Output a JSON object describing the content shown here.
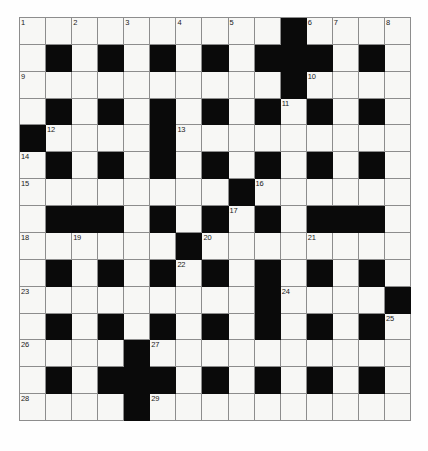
{
  "puzzle": {
    "type": "crossword-grid",
    "rows": 15,
    "columns": 15,
    "colors": {
      "block": "#0a0a0a",
      "cell": "#f7f7f5",
      "gridline": "#8d8d8d",
      "number": "#1a1a1a",
      "page_background": "#fefefe"
    },
    "grid": [
      [
        {
          "block": false,
          "number": "1"
        },
        {
          "block": false,
          "number": ""
        },
        {
          "block": false,
          "number": "2"
        },
        {
          "block": false,
          "number": ""
        },
        {
          "block": false,
          "number": "3"
        },
        {
          "block": false,
          "number": ""
        },
        {
          "block": false,
          "number": "4"
        },
        {
          "block": false,
          "number": ""
        },
        {
          "block": false,
          "number": "5"
        },
        {
          "block": false,
          "number": ""
        },
        {
          "block": true,
          "number": ""
        },
        {
          "block": false,
          "number": "6"
        },
        {
          "block": false,
          "number": "7"
        },
        {
          "block": false,
          "number": ""
        },
        {
          "block": false,
          "number": "8"
        }
      ],
      [
        {
          "block": false,
          "number": ""
        },
        {
          "block": true,
          "number": ""
        },
        {
          "block": false,
          "number": ""
        },
        {
          "block": true,
          "number": ""
        },
        {
          "block": false,
          "number": ""
        },
        {
          "block": true,
          "number": ""
        },
        {
          "block": false,
          "number": ""
        },
        {
          "block": true,
          "number": ""
        },
        {
          "block": false,
          "number": ""
        },
        {
          "block": true,
          "number": ""
        },
        {
          "block": true,
          "number": ""
        },
        {
          "block": true,
          "number": ""
        },
        {
          "block": false,
          "number": ""
        },
        {
          "block": true,
          "number": ""
        },
        {
          "block": false,
          "number": ""
        }
      ],
      [
        {
          "block": false,
          "number": "9"
        },
        {
          "block": false,
          "number": ""
        },
        {
          "block": false,
          "number": ""
        },
        {
          "block": false,
          "number": ""
        },
        {
          "block": false,
          "number": ""
        },
        {
          "block": false,
          "number": ""
        },
        {
          "block": false,
          "number": ""
        },
        {
          "block": false,
          "number": ""
        },
        {
          "block": false,
          "number": ""
        },
        {
          "block": false,
          "number": ""
        },
        {
          "block": true,
          "number": ""
        },
        {
          "block": false,
          "number": "10"
        },
        {
          "block": false,
          "number": ""
        },
        {
          "block": false,
          "number": ""
        },
        {
          "block": false,
          "number": ""
        }
      ],
      [
        {
          "block": false,
          "number": ""
        },
        {
          "block": true,
          "number": ""
        },
        {
          "block": false,
          "number": ""
        },
        {
          "block": true,
          "number": ""
        },
        {
          "block": false,
          "number": ""
        },
        {
          "block": true,
          "number": ""
        },
        {
          "block": false,
          "number": ""
        },
        {
          "block": true,
          "number": ""
        },
        {
          "block": false,
          "number": ""
        },
        {
          "block": true,
          "number": ""
        },
        {
          "block": false,
          "number": "11"
        },
        {
          "block": true,
          "number": ""
        },
        {
          "block": false,
          "number": ""
        },
        {
          "block": true,
          "number": ""
        },
        {
          "block": false,
          "number": ""
        }
      ],
      [
        {
          "block": true,
          "number": ""
        },
        {
          "block": false,
          "number": "12"
        },
        {
          "block": false,
          "number": ""
        },
        {
          "block": false,
          "number": ""
        },
        {
          "block": false,
          "number": ""
        },
        {
          "block": true,
          "number": ""
        },
        {
          "block": false,
          "number": "13"
        },
        {
          "block": false,
          "number": ""
        },
        {
          "block": false,
          "number": ""
        },
        {
          "block": false,
          "number": ""
        },
        {
          "block": false,
          "number": ""
        },
        {
          "block": false,
          "number": ""
        },
        {
          "block": false,
          "number": ""
        },
        {
          "block": false,
          "number": ""
        },
        {
          "block": false,
          "number": ""
        }
      ],
      [
        {
          "block": false,
          "number": "14"
        },
        {
          "block": true,
          "number": ""
        },
        {
          "block": false,
          "number": ""
        },
        {
          "block": true,
          "number": ""
        },
        {
          "block": false,
          "number": ""
        },
        {
          "block": true,
          "number": ""
        },
        {
          "block": false,
          "number": ""
        },
        {
          "block": true,
          "number": ""
        },
        {
          "block": false,
          "number": ""
        },
        {
          "block": true,
          "number": ""
        },
        {
          "block": false,
          "number": ""
        },
        {
          "block": true,
          "number": ""
        },
        {
          "block": false,
          "number": ""
        },
        {
          "block": true,
          "number": ""
        },
        {
          "block": false,
          "number": ""
        }
      ],
      [
        {
          "block": false,
          "number": "15"
        },
        {
          "block": false,
          "number": ""
        },
        {
          "block": false,
          "number": ""
        },
        {
          "block": false,
          "number": ""
        },
        {
          "block": false,
          "number": ""
        },
        {
          "block": false,
          "number": ""
        },
        {
          "block": false,
          "number": ""
        },
        {
          "block": false,
          "number": ""
        },
        {
          "block": true,
          "number": ""
        },
        {
          "block": false,
          "number": "16"
        },
        {
          "block": false,
          "number": ""
        },
        {
          "block": false,
          "number": ""
        },
        {
          "block": false,
          "number": ""
        },
        {
          "block": false,
          "number": ""
        },
        {
          "block": false,
          "number": ""
        }
      ],
      [
        {
          "block": false,
          "number": ""
        },
        {
          "block": true,
          "number": ""
        },
        {
          "block": true,
          "number": ""
        },
        {
          "block": true,
          "number": ""
        },
        {
          "block": false,
          "number": ""
        },
        {
          "block": true,
          "number": ""
        },
        {
          "block": false,
          "number": ""
        },
        {
          "block": true,
          "number": ""
        },
        {
          "block": false,
          "number": "17"
        },
        {
          "block": true,
          "number": ""
        },
        {
          "block": false,
          "number": ""
        },
        {
          "block": true,
          "number": ""
        },
        {
          "block": true,
          "number": ""
        },
        {
          "block": true,
          "number": ""
        },
        {
          "block": false,
          "number": ""
        }
      ],
      [
        {
          "block": false,
          "number": "18"
        },
        {
          "block": false,
          "number": ""
        },
        {
          "block": false,
          "number": "19"
        },
        {
          "block": false,
          "number": ""
        },
        {
          "block": false,
          "number": ""
        },
        {
          "block": false,
          "number": ""
        },
        {
          "block": true,
          "number": ""
        },
        {
          "block": false,
          "number": "20"
        },
        {
          "block": false,
          "number": ""
        },
        {
          "block": false,
          "number": ""
        },
        {
          "block": false,
          "number": ""
        },
        {
          "block": false,
          "number": "21"
        },
        {
          "block": false,
          "number": ""
        },
        {
          "block": false,
          "number": ""
        },
        {
          "block": false,
          "number": ""
        }
      ],
      [
        {
          "block": false,
          "number": ""
        },
        {
          "block": true,
          "number": ""
        },
        {
          "block": false,
          "number": ""
        },
        {
          "block": true,
          "number": ""
        },
        {
          "block": false,
          "number": ""
        },
        {
          "block": true,
          "number": ""
        },
        {
          "block": false,
          "number": "22"
        },
        {
          "block": true,
          "number": ""
        },
        {
          "block": false,
          "number": ""
        },
        {
          "block": true,
          "number": ""
        },
        {
          "block": false,
          "number": ""
        },
        {
          "block": true,
          "number": ""
        },
        {
          "block": false,
          "number": ""
        },
        {
          "block": true,
          "number": ""
        },
        {
          "block": false,
          "number": ""
        }
      ],
      [
        {
          "block": false,
          "number": "23"
        },
        {
          "block": false,
          "number": ""
        },
        {
          "block": false,
          "number": ""
        },
        {
          "block": false,
          "number": ""
        },
        {
          "block": false,
          "number": ""
        },
        {
          "block": false,
          "number": ""
        },
        {
          "block": false,
          "number": ""
        },
        {
          "block": false,
          "number": ""
        },
        {
          "block": false,
          "number": ""
        },
        {
          "block": true,
          "number": ""
        },
        {
          "block": false,
          "number": "24"
        },
        {
          "block": false,
          "number": ""
        },
        {
          "block": false,
          "number": ""
        },
        {
          "block": false,
          "number": ""
        },
        {
          "block": true,
          "number": ""
        }
      ],
      [
        {
          "block": false,
          "number": ""
        },
        {
          "block": true,
          "number": ""
        },
        {
          "block": false,
          "number": ""
        },
        {
          "block": true,
          "number": ""
        },
        {
          "block": false,
          "number": ""
        },
        {
          "block": true,
          "number": ""
        },
        {
          "block": false,
          "number": ""
        },
        {
          "block": true,
          "number": ""
        },
        {
          "block": false,
          "number": ""
        },
        {
          "block": true,
          "number": ""
        },
        {
          "block": false,
          "number": ""
        },
        {
          "block": true,
          "number": ""
        },
        {
          "block": false,
          "number": ""
        },
        {
          "block": true,
          "number": ""
        },
        {
          "block": false,
          "number": "25"
        }
      ],
      [
        {
          "block": false,
          "number": "26"
        },
        {
          "block": false,
          "number": ""
        },
        {
          "block": false,
          "number": ""
        },
        {
          "block": false,
          "number": ""
        },
        {
          "block": true,
          "number": ""
        },
        {
          "block": false,
          "number": "27"
        },
        {
          "block": false,
          "number": ""
        },
        {
          "block": false,
          "number": ""
        },
        {
          "block": false,
          "number": ""
        },
        {
          "block": false,
          "number": ""
        },
        {
          "block": false,
          "number": ""
        },
        {
          "block": false,
          "number": ""
        },
        {
          "block": false,
          "number": ""
        },
        {
          "block": false,
          "number": ""
        },
        {
          "block": false,
          "number": ""
        }
      ],
      [
        {
          "block": false,
          "number": ""
        },
        {
          "block": true,
          "number": ""
        },
        {
          "block": false,
          "number": ""
        },
        {
          "block": true,
          "number": ""
        },
        {
          "block": true,
          "number": ""
        },
        {
          "block": true,
          "number": ""
        },
        {
          "block": false,
          "number": ""
        },
        {
          "block": true,
          "number": ""
        },
        {
          "block": false,
          "number": ""
        },
        {
          "block": true,
          "number": ""
        },
        {
          "block": false,
          "number": ""
        },
        {
          "block": true,
          "number": ""
        },
        {
          "block": false,
          "number": ""
        },
        {
          "block": true,
          "number": ""
        },
        {
          "block": false,
          "number": ""
        }
      ],
      [
        {
          "block": false,
          "number": "28"
        },
        {
          "block": false,
          "number": ""
        },
        {
          "block": false,
          "number": ""
        },
        {
          "block": false,
          "number": ""
        },
        {
          "block": true,
          "number": ""
        },
        {
          "block": false,
          "number": "29"
        },
        {
          "block": false,
          "number": ""
        },
        {
          "block": false,
          "number": ""
        },
        {
          "block": false,
          "number": ""
        },
        {
          "block": false,
          "number": ""
        },
        {
          "block": false,
          "number": ""
        },
        {
          "block": false,
          "number": ""
        },
        {
          "block": false,
          "number": ""
        },
        {
          "block": false,
          "number": ""
        },
        {
          "block": false,
          "number": ""
        }
      ]
    ]
  }
}
